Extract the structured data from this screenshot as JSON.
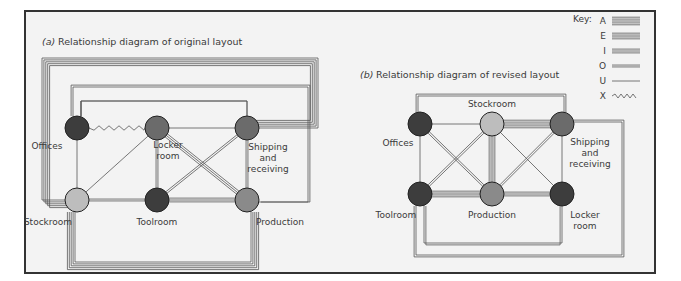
{
  "key": {
    "label": "Key:",
    "items": [
      {
        "code": "A",
        "lines": 5
      },
      {
        "code": "E",
        "lines": 4
      },
      {
        "code": "I",
        "lines": 3
      },
      {
        "code": "O",
        "lines": 2
      },
      {
        "code": "U",
        "lines": 1
      },
      {
        "code": "X",
        "lines": 0,
        "wavy": true
      }
    ]
  },
  "colors": {
    "frame": "#333333",
    "background": "#f3f3f3",
    "line": "#555555",
    "node_dark": "#3d3d3d",
    "node_mid": "#6b6b6b",
    "node_light": "#bdbdbd",
    "node_medium": "#8a8a8a"
  },
  "diagrams": [
    {
      "id": "original",
      "prefix": "(a)",
      "title": "Relationship diagram of original layout",
      "nodes": [
        {
          "id": "offices",
          "label": [
            "Offices"
          ],
          "shade": "node_dark"
        },
        {
          "id": "locker",
          "label": [
            "Locker",
            "room"
          ],
          "shade": "node_mid"
        },
        {
          "id": "shipping",
          "label": [
            "Shipping",
            "and",
            "receiving"
          ],
          "shade": "node_mid"
        },
        {
          "id": "stockroom",
          "label": [
            "Stockroom"
          ],
          "shade": "node_light"
        },
        {
          "id": "toolroom",
          "label": [
            "Toolroom"
          ],
          "shade": "node_dark"
        },
        {
          "id": "production",
          "label": [
            "Production"
          ],
          "shade": "node_medium"
        }
      ],
      "edges": [
        {
          "from": "offices",
          "to": "locker",
          "rating": "X"
        },
        {
          "from": "offices",
          "to": "stockroom",
          "rating": "U"
        },
        {
          "from": "locker",
          "to": "shipping",
          "rating": "U"
        },
        {
          "from": "locker",
          "to": "stockroom",
          "rating": "U"
        },
        {
          "from": "locker",
          "to": "toolroom",
          "rating": "O"
        },
        {
          "from": "locker",
          "to": "production",
          "rating": "I"
        },
        {
          "from": "shipping",
          "to": "toolroom",
          "rating": "O"
        },
        {
          "from": "shipping",
          "to": "production",
          "rating": "O"
        },
        {
          "from": "stockroom",
          "to": "toolroom",
          "rating": "O"
        },
        {
          "from": "toolroom",
          "to": "production",
          "rating": "I"
        },
        {
          "from": "stockroom",
          "to": "shipping",
          "rating": "A",
          "route": "outer-top"
        },
        {
          "from": "offices",
          "to": "production",
          "rating": "O",
          "route": "mid-top"
        },
        {
          "from": "locker",
          "to": "offices",
          "rating": "U",
          "route": "inner-top"
        },
        {
          "from": "stockroom",
          "to": "production",
          "rating": "A",
          "route": "bottom"
        }
      ]
    },
    {
      "id": "revised",
      "prefix": "(b)",
      "title": "Relationship diagram of revised layout",
      "nodes": [
        {
          "id": "offices",
          "label": [
            "Offices"
          ],
          "shade": "node_dark"
        },
        {
          "id": "stockroom",
          "label": [
            "Stockroom"
          ],
          "shade": "node_light"
        },
        {
          "id": "shipping",
          "label": [
            "Shipping",
            "and",
            "receiving"
          ],
          "shade": "node_mid"
        },
        {
          "id": "toolroom",
          "label": [
            "Toolroom"
          ],
          "shade": "node_dark"
        },
        {
          "id": "production",
          "label": [
            "Production"
          ],
          "shade": "node_medium"
        },
        {
          "id": "locker",
          "label": [
            "Locker",
            "room"
          ],
          "shade": "node_dark"
        }
      ],
      "edges": [
        {
          "from": "offices",
          "to": "stockroom",
          "rating": "U"
        },
        {
          "from": "stockroom",
          "to": "shipping",
          "rating": "A"
        },
        {
          "from": "offices",
          "to": "toolroom",
          "rating": "U"
        },
        {
          "from": "offices",
          "to": "production",
          "rating": "O"
        },
        {
          "from": "stockroom",
          "to": "toolroom",
          "rating": "O"
        },
        {
          "from": "stockroom",
          "to": "production",
          "rating": "E"
        },
        {
          "from": "stockroom",
          "to": "locker",
          "rating": "U"
        },
        {
          "from": "shipping",
          "to": "production",
          "rating": "O"
        },
        {
          "from": "shipping",
          "to": "locker",
          "rating": "U"
        },
        {
          "from": "toolroom",
          "to": "production",
          "rating": "E"
        },
        {
          "from": "production",
          "to": "locker",
          "rating": "I"
        },
        {
          "from": "offices",
          "to": "shipping",
          "rating": "O",
          "route": "top"
        },
        {
          "from": "toolroom",
          "to": "locker",
          "rating": "O",
          "route": "bottom-inner"
        },
        {
          "from": "toolroom",
          "to": "shipping",
          "rating": "O",
          "route": "bottom-outer-right"
        }
      ]
    }
  ]
}
